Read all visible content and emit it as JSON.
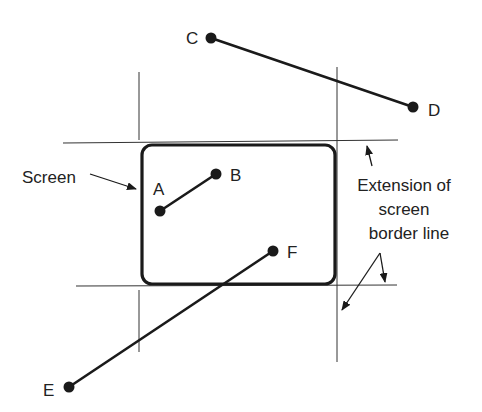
{
  "diagram": {
    "colors": {
      "ink": "#1a1a1a",
      "thin": "#333333",
      "background": "#ffffff"
    },
    "screen": {
      "x": 141,
      "y": 145,
      "width": 194,
      "height": 139,
      "rx": 10,
      "label": "Screen"
    },
    "extension_lines": {
      "horizontal": [
        {
          "x1": 63,
          "y1": 143,
          "x2": 398,
          "y2": 140
        },
        {
          "x1": 76,
          "y1": 286,
          "x2": 397,
          "y2": 285
        }
      ],
      "vertical": [
        {
          "x1": 139,
          "y1": 72,
          "x2": 139,
          "y2": 140
        },
        {
          "x1": 139,
          "y1": 290,
          "x2": 139,
          "y2": 352
        },
        {
          "x1": 337,
          "y1": 67,
          "x2": 337,
          "y2": 362
        }
      ],
      "label_lines": [
        "Extension of",
        "screen",
        "border line"
      ]
    },
    "segments": [
      {
        "name": "A-B",
        "from": {
          "label": "A",
          "x": 160,
          "y": 211
        },
        "to": {
          "label": "B",
          "x": 216,
          "y": 174
        }
      },
      {
        "name": "C-D",
        "from": {
          "label": "C",
          "x": 211,
          "y": 38
        },
        "to": {
          "label": "D",
          "x": 413,
          "y": 107
        }
      },
      {
        "name": "E-F",
        "from": {
          "label": "E",
          "x": 69,
          "y": 387
        },
        "to": {
          "label": "F",
          "x": 273,
          "y": 251
        }
      }
    ],
    "point_labels": {
      "A": "A",
      "B": "B",
      "C": "C",
      "D": "D",
      "E": "E",
      "F": "F"
    }
  }
}
